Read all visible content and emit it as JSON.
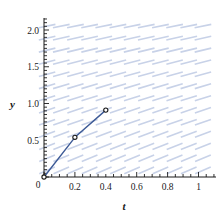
{
  "chart_data": {
    "type": "line",
    "title": "",
    "xlabel": "t",
    "ylabel": "y",
    "xlim": [
      0,
      1.1
    ],
    "ylim": [
      0,
      2.15
    ],
    "grid": false,
    "legend": "none",
    "xticks": [
      0,
      0.2,
      0.4,
      0.6,
      0.8,
      1
    ],
    "xtick_labels": [
      "0",
      "0.2",
      "0.4",
      "0.6",
      "0.8",
      "1"
    ],
    "yticks": [
      0,
      0.5,
      1.0,
      1.5,
      2.0
    ],
    "ytick_labels": [
      "0",
      "0.5",
      "1.0",
      "1.5",
      "2.0"
    ],
    "minor_tick_step": 0.05,
    "series": [
      {
        "name": "euler-solution",
        "color": "#3d5a96",
        "marker": "circle-open",
        "x": [
          0,
          0.2,
          0.4
        ],
        "y": [
          0,
          0.54,
          0.91
        ]
      }
    ],
    "direction_field": {
      "name": "slope-field",
      "color": "#c8d2e8",
      "x_start": 0.02,
      "x_step": 0.0917,
      "x_count": 12,
      "y_start": 0.09,
      "y_step": 0.1636,
      "y_count": 13,
      "segment_length_px": 17,
      "slope_angle_deg_top_left": 11,
      "slope_angle_deg_bottom": 24
    }
  },
  "axes": {
    "y_axis_label": "y",
    "x_axis_label": "t",
    "origin_label": "0"
  }
}
